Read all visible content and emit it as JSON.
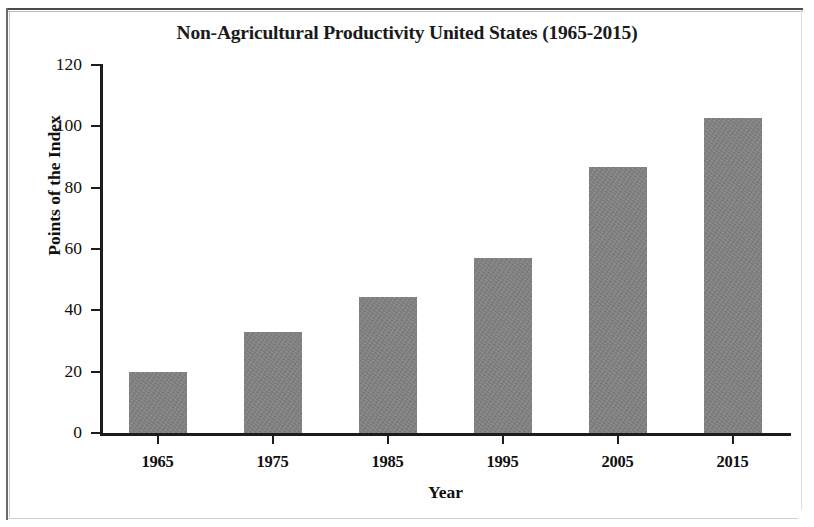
{
  "chart_data": {
    "type": "bar",
    "title": "Non-Agricultural Productivity United States (1965-2015)",
    "xlabel": "Year",
    "ylabel": "Points of the Index",
    "categories": [
      "1965",
      "1975",
      "1985",
      "1995",
      "2005",
      "2015"
    ],
    "values": [
      19.8,
      32.8,
      44.2,
      57,
      86.7,
      102.8
    ],
    "series": [
      {
        "name": "Points of the Index",
        "values": [
          19.8,
          32.8,
          44.2,
          57,
          86.7,
          102.8
        ]
      }
    ],
    "ylim": [
      0,
      120
    ],
    "ytick_labels": [
      "0",
      "20",
      "40",
      "60",
      "80",
      "100",
      "120"
    ],
    "ytick_values": [
      0,
      20,
      40,
      60,
      80,
      100,
      120
    ],
    "grid": false,
    "legend": false,
    "legend_position": "none",
    "bar_color": "#828282",
    "axis_color": "#1c1c1c",
    "text_color": "#101010",
    "background_color": "#ffffff"
  }
}
